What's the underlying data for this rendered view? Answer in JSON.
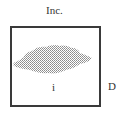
{
  "diagram": {
    "top_label": "Inc.",
    "inner_label": "i",
    "side_label": "D",
    "box": {
      "border_color": "#3a3a3a"
    },
    "region": {
      "description": "irregular stippled gray region",
      "fill_color": "#9a9a9a"
    }
  }
}
